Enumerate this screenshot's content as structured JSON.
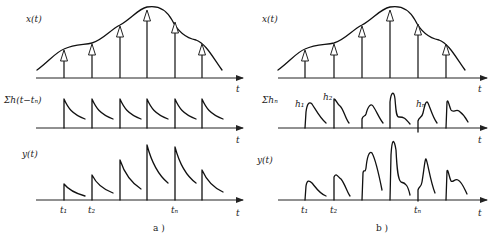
{
  "panels": [
    {
      "id": "a",
      "caption": "a )",
      "rows": [
        {
          "label": "x(t)",
          "axis_label": "t"
        },
        {
          "label": "Σh(t−tₙ)",
          "axis_label": "t"
        },
        {
          "label": "y(t)",
          "axis_label": "t"
        }
      ],
      "tick_labels": [
        "t₁",
        "t₂",
        "tₙ"
      ]
    },
    {
      "id": "b",
      "caption": "b )",
      "rows": [
        {
          "label": "x(t)",
          "axis_label": "t"
        },
        {
          "label": "Σhₙ",
          "axis_label": "t"
        },
        {
          "label": "y(t)",
          "axis_label": "t"
        }
      ],
      "pulse_labels": [
        "h₁",
        "h₂",
        "hₙ"
      ],
      "tick_labels": [
        "t₁",
        "t₂",
        "tₙ"
      ]
    }
  ]
}
